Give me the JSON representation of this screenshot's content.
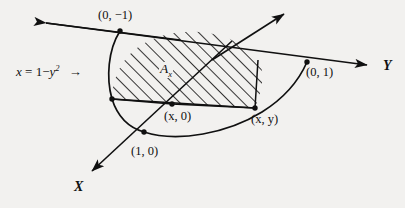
{
  "figure": {
    "background_color": "#f2f1ef",
    "ink_color": "#101010",
    "equation": {
      "lhs": "x",
      "equals": "=",
      "rhs_lead": "1",
      "minus": "−",
      "rhs_var": "y",
      "rhs_exp": "2",
      "pointer": "→"
    },
    "axes": [
      {
        "name": "x-axis",
        "label": "X"
      },
      {
        "name": "y-axis",
        "label": "Y"
      },
      {
        "name": "z-axis",
        "label": ""
      }
    ],
    "region": {
      "name": "cross-section-area",
      "label": "A",
      "sub": "x"
    },
    "points": [
      {
        "name": "point-0-neg1",
        "label": "(0, −1)",
        "x": 120,
        "y": 31
      },
      {
        "name": "point-0-1",
        "label": "(0, 1)",
        "x": 307,
        "y": 62
      },
      {
        "name": "point-x-0",
        "label": "(x, 0)",
        "x": 172,
        "y": 104
      },
      {
        "name": "point-x-y",
        "label": "(x, y)",
        "x": 255,
        "y": 108
      },
      {
        "name": "point-1-0",
        "label": "(1, 0)",
        "x": 144,
        "y": 132
      },
      {
        "name": "point-origin-left",
        "label": "",
        "x": 112,
        "y": 99
      }
    ]
  }
}
